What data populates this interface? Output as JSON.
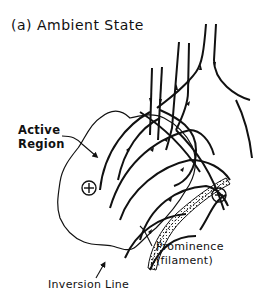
{
  "figure": {
    "title": "(a) Ambient State",
    "labels": {
      "active_region_line1": "Active",
      "active_region_line2": "Region",
      "prominence_line1": "Prominence",
      "prominence_line2": "(filament)",
      "inversion_line": "Inversion Line"
    },
    "polarity": {
      "positive": "+",
      "negative": "−"
    },
    "colors": {
      "ink": "#111111",
      "background": "#ffffff"
    }
  }
}
